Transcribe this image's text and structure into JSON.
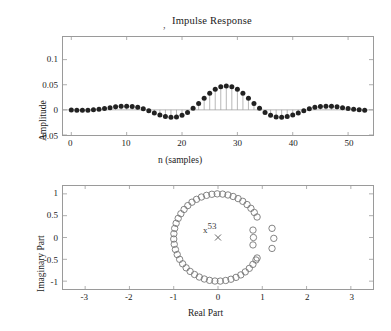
{
  "figure": {
    "cropped_header_text": "",
    "background_color": "#ffffff",
    "axis_color": "#9a9a9a",
    "marker_color": "#222222",
    "stem_color": "#9a9a9a",
    "zero_color": "#777777"
  },
  "top_plot": {
    "title": "Impulse Response",
    "title_prefix_mark": ",",
    "xlabel": "n (samples)",
    "ylabel": "Amplitude",
    "xticks": [
      "0",
      "10",
      "20",
      "30",
      "40",
      "50"
    ],
    "yticks": [
      "-0.05",
      "0",
      "0.05",
      "0.1"
    ]
  },
  "bottom_plot": {
    "xlabel": "Real Part",
    "ylabel": "Imaginary Part",
    "xticks": [
      "-3",
      "-2",
      "-1",
      "0",
      "1",
      "2",
      "3"
    ],
    "yticks": [
      "-1",
      "-0.5",
      "0",
      "0.5",
      "1"
    ],
    "pole_marker": "x",
    "pole_multiplicity": "53"
  },
  "chart_data": [
    {
      "type": "bar",
      "plot_style": "stem",
      "title": "Impulse Response",
      "xlabel": "n (samples)",
      "ylabel": "Amplitude",
      "xlim": [
        -1.5,
        54.5
      ],
      "ylim": [
        -0.05,
        0.145
      ],
      "xticks": [
        0,
        10,
        20,
        30,
        40,
        50
      ],
      "yticks": [
        -0.05,
        0,
        0.05,
        0.1
      ],
      "grid": false,
      "categories": [
        0,
        1,
        2,
        3,
        4,
        5,
        6,
        7,
        8,
        9,
        10,
        11,
        12,
        13,
        14,
        15,
        16,
        17,
        18,
        19,
        20,
        21,
        22,
        23,
        24,
        25,
        26,
        27,
        28,
        29,
        30,
        31,
        32,
        33,
        34,
        35,
        36,
        37,
        38,
        39,
        40,
        41,
        42,
        43,
        44,
        45,
        46,
        47,
        48,
        49,
        50,
        51,
        52,
        53
      ],
      "values": [
        -0.0005,
        -0.0008,
        -0.001,
        -0.0007,
        0.0,
        0.0012,
        0.0028,
        0.0044,
        0.006,
        0.007,
        0.0074,
        0.0068,
        0.005,
        0.0022,
        -0.0016,
        -0.006,
        -0.0102,
        -0.0133,
        -0.0147,
        -0.014,
        -0.0108,
        -0.005,
        0.003,
        0.0128,
        0.0232,
        0.033,
        0.041,
        0.046,
        0.0476,
        0.046,
        0.041,
        0.033,
        0.0232,
        0.0128,
        0.003,
        -0.005,
        -0.0108,
        -0.014,
        -0.0147,
        -0.0133,
        -0.0102,
        -0.006,
        -0.0016,
        0.0022,
        0.005,
        0.0068,
        0.0074,
        0.007,
        0.006,
        0.0044,
        0.0028,
        0.0012,
        0.0,
        -0.0007
      ]
    },
    {
      "type": "scatter",
      "plot_style": "pole-zero",
      "xlabel": "Real Part",
      "ylabel": "Imaginary Part",
      "xlim": [
        -3.5,
        3.5
      ],
      "ylim": [
        -1.18,
        1.18
      ],
      "xticks": [
        -3,
        -2,
        -1,
        0,
        1,
        2,
        3
      ],
      "yticks": [
        -1,
        -0.5,
        0,
        0.5,
        1
      ],
      "grid": false,
      "series": [
        {
          "name": "zeros-unit-circle",
          "marker": "o",
          "radius": 1.0,
          "angles_deg": [
            28,
            35,
            42,
            49,
            56,
            63,
            70,
            77,
            84,
            91,
            98,
            105,
            112,
            119,
            126,
            133,
            140,
            147,
            154,
            161,
            168,
            175,
            182,
            189,
            196,
            203,
            210,
            217,
            224,
            231,
            238,
            245,
            252,
            259,
            266,
            273,
            280,
            287,
            294,
            301,
            308,
            315,
            322,
            329,
            332
          ]
        },
        {
          "name": "zeros-inside-right",
          "marker": "o",
          "points": [
            [
              0.79,
              0.17
            ],
            [
              0.8,
              0.0
            ],
            [
              0.79,
              -0.17
            ]
          ]
        },
        {
          "name": "zeros-outside-right",
          "marker": "o",
          "points": [
            [
              1.22,
              0.21
            ],
            [
              1.26,
              -0.02
            ],
            [
              1.22,
              -0.25
            ]
          ]
        },
        {
          "name": "poles-at-origin",
          "marker": "x",
          "points": [
            [
              0.0,
              0.0
            ]
          ],
          "multiplicity": 53
        }
      ]
    }
  ]
}
